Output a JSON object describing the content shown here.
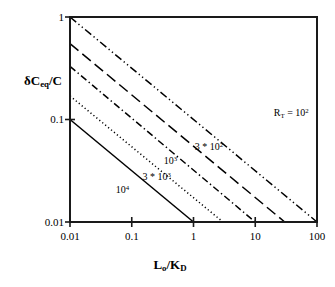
{
  "chart_data": {
    "type": "line",
    "title": "",
    "xlabel": "L_o / K_D",
    "ylabel": "δC_eq / C",
    "xscale": "log",
    "yscale": "log",
    "xlim": [
      0.01,
      100
    ],
    "ylim": [
      0.01,
      1
    ],
    "grid": false,
    "legend_position": "inline-annotations",
    "x_ticks": [
      "0.01",
      "0.1",
      "1",
      "10",
      "100"
    ],
    "x_tick_values": [
      0.01,
      0.1,
      1,
      10,
      100
    ],
    "y_ticks": [
      "1",
      "0.1",
      "0.01"
    ],
    "y_tick_values": [
      1,
      0.1,
      0.01
    ],
    "series": [
      {
        "name": "R_T = 10^2",
        "label": "R",
        "label_sub": "T",
        "label_eq": " = 10",
        "label_sup": "2",
        "linestyle": "dash-dot-dot",
        "color": "#000000",
        "x": [
          0.01,
          100
        ],
        "y": [
          1.0,
          0.01
        ],
        "slope": -1,
        "label_x": 20,
        "label_y": 0.115
      },
      {
        "name": "3 * 10^2",
        "label": "3 * 10",
        "label_sup": "2",
        "linestyle": "long-dash",
        "color": "#000000",
        "x": [
          0.01,
          30
        ],
        "y": [
          0.55,
          0.01
        ],
        "slope": -1,
        "label_x": 1.05,
        "label_y": 0.054
      },
      {
        "name": "10^3",
        "label": "10",
        "label_sup": "3",
        "linestyle": "dash-dot",
        "color": "#000000",
        "x": [
          0.01,
          10
        ],
        "y": [
          0.33,
          0.01
        ],
        "slope": -1,
        "label_x": 0.33,
        "label_y": 0.039
      },
      {
        "name": "3 * 10^3",
        "label": "3 * 10",
        "label_sup": "3",
        "linestyle": "dotted",
        "color": "#000000",
        "x": [
          0.01,
          3
        ],
        "y": [
          0.17,
          0.01
        ],
        "slope": -1,
        "label_x": 0.15,
        "label_y": 0.0275
      },
      {
        "name": "10^4",
        "label": "10",
        "label_sup": "4",
        "linestyle": "solid",
        "color": "#000000",
        "x": [
          0.01,
          1
        ],
        "y": [
          0.1,
          0.01
        ],
        "slope": -1,
        "label_x": 0.055,
        "label_y": 0.0205
      }
    ]
  },
  "axes": {
    "y_label_parts": {
      "delta": "δC",
      "sub": "eq",
      "tail": "/C"
    },
    "x_label_parts": {
      "main": "L",
      "sub": "o",
      "mid": "/K",
      "sub2": "D"
    },
    "frame_color": "#1a1a1a"
  },
  "ticks": {
    "y": [
      {
        "text": "1",
        "value": 1
      },
      {
        "text": "0.1",
        "value": 0.1
      },
      {
        "text": "0.01",
        "value": 0.01
      }
    ],
    "x": [
      {
        "text": "0.01",
        "value": 0.01
      },
      {
        "text": "0.1",
        "value": 0.1
      },
      {
        "text": "1",
        "value": 1
      },
      {
        "text": "10",
        "value": 10
      },
      {
        "text": "100",
        "value": 100
      }
    ]
  }
}
